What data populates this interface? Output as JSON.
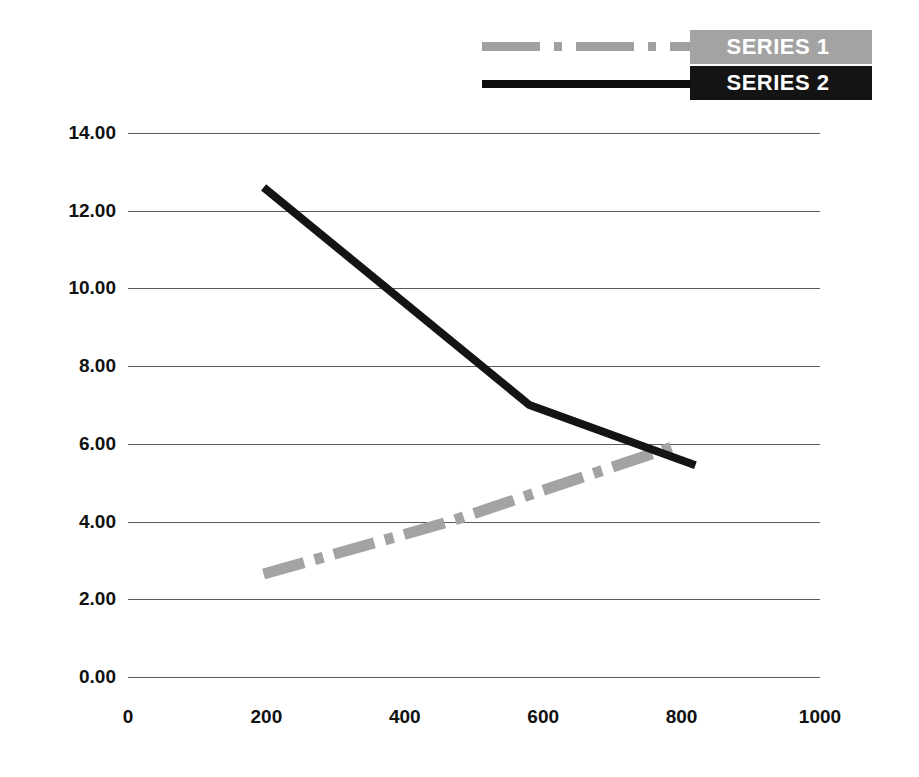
{
  "chart_data": {
    "type": "line",
    "title": "",
    "xlabel": "",
    "ylabel": "",
    "xlim": [
      0,
      1000
    ],
    "ylim": [
      0,
      14
    ],
    "grid": true,
    "legend_position": "top-right",
    "x_ticks": [
      "0",
      "200",
      "400",
      "600",
      "800",
      "1000"
    ],
    "x_tick_values": [
      0,
      200,
      400,
      600,
      800,
      1000
    ],
    "y_ticks": [
      "0.00",
      "2.00",
      "4.00",
      "6.00",
      "8.00",
      "10.00",
      "12.00",
      "14.00"
    ],
    "y_tick_values": [
      0,
      2,
      4,
      6,
      8,
      10,
      12,
      14
    ],
    "series": [
      {
        "name": "SERIES 1",
        "color": "#a3a3a3",
        "style": "dash-dot",
        "points": [
          {
            "x": 196,
            "y": 2.65
          },
          {
            "x": 465,
            "y": 4.0
          },
          {
            "x": 800,
            "y": 6.0
          }
        ]
      },
      {
        "name": "SERIES 2",
        "color": "#141414",
        "style": "solid",
        "points": [
          {
            "x": 196,
            "y": 12.6
          },
          {
            "x": 580,
            "y": 7.0
          },
          {
            "x": 820,
            "y": 5.45
          }
        ]
      }
    ]
  },
  "legend": {
    "items": [
      {
        "label": "SERIES 1",
        "swatch": "dash-dot-line-swatch",
        "color": "#a3a3a3"
      },
      {
        "label": "SERIES 2",
        "swatch": "solid-line-swatch",
        "color": "#141414"
      }
    ]
  }
}
